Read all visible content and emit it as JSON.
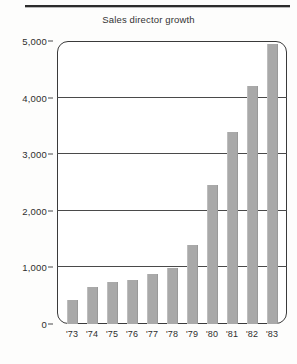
{
  "page": {
    "rule_color": "#2c2c2c",
    "background": "#fdfdfc"
  },
  "chart_data": {
    "type": "bar",
    "title": "Sales director growth",
    "xlabel": "",
    "ylabel": "",
    "categories": [
      "'73",
      "'74",
      "'75",
      "'76",
      "'77",
      "'78",
      "'79",
      "'80",
      "'81",
      "'82",
      "'83"
    ],
    "values": [
      420,
      650,
      740,
      780,
      880,
      990,
      1400,
      2450,
      3400,
      4200,
      4950
    ],
    "ylim": [
      0,
      5000
    ],
    "ytick_values": [
      0,
      1000,
      2000,
      3000,
      4000,
      5000
    ],
    "ytick_labels": [
      "0",
      "1,000",
      "2,000",
      "3,000",
      "4,000",
      "5,000"
    ],
    "grid": true,
    "grid_axis": "y",
    "legend": null,
    "bar_color": "#a9a9a9",
    "frame_color": "#3a3a3a"
  }
}
